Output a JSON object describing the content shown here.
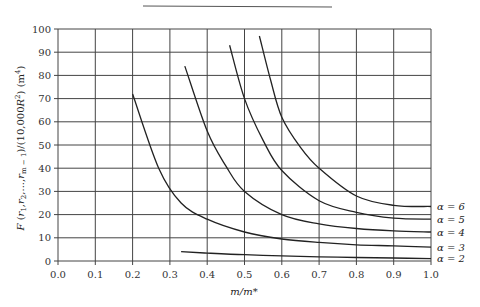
{
  "chart_data": {
    "type": "line",
    "title": "",
    "xlabel": "m/m*",
    "ylabel": "F(r1,r2,...,rm-1)/(10,000R²) (m⁴)",
    "xlim": [
      0.0,
      1.0
    ],
    "ylim": [
      0,
      100
    ],
    "grid": true,
    "legend_position": "right-inline",
    "x_ticks": [
      "0.0",
      "0.1",
      "0.2",
      "0.3",
      "0.4",
      "0.5",
      "0.6",
      "0.7",
      "0.8",
      "0.9",
      "1.0"
    ],
    "y_ticks": [
      "0",
      "10",
      "20",
      "30",
      "40",
      "50",
      "60",
      "70",
      "80",
      "90",
      "100"
    ],
    "series": [
      {
        "name": "α = 2",
        "x": [
          0.33,
          0.4,
          0.5,
          0.6,
          0.7,
          0.8,
          0.9,
          1.0
        ],
        "y": [
          4,
          3.4,
          2.7,
          2.2,
          1.8,
          1.5,
          1.3,
          1.0
        ]
      },
      {
        "name": "α = 3",
        "x": [
          0.2,
          0.27,
          0.33,
          0.4,
          0.5,
          0.6,
          0.7,
          0.8,
          0.9,
          1.0
        ],
        "y": [
          72,
          40,
          25,
          18,
          12.5,
          9.5,
          8,
          7,
          6.5,
          6
        ]
      },
      {
        "name": "α = 4",
        "x": [
          0.34,
          0.4,
          0.45,
          0.5,
          0.6,
          0.7,
          0.8,
          0.9,
          1.0
        ],
        "y": [
          84,
          56,
          41,
          30,
          20,
          16,
          14,
          13,
          12.5
        ]
      },
      {
        "name": "α = 5",
        "x": [
          0.46,
          0.5,
          0.55,
          0.6,
          0.7,
          0.8,
          0.9,
          1.0
        ],
        "y": [
          93,
          70,
          52,
          39,
          26,
          21,
          18.5,
          18
        ]
      },
      {
        "name": "α = 6",
        "x": [
          0.54,
          0.57,
          0.6,
          0.65,
          0.7,
          0.8,
          0.9,
          1.0
        ],
        "y": [
          97,
          78,
          62,
          49,
          40,
          28,
          24,
          23.5
        ]
      }
    ]
  },
  "labels": {
    "xlabel": "m/m*",
    "series_labels": [
      "α = 6",
      "α = 5",
      "α = 4",
      "α = 3",
      "α = 2"
    ]
  }
}
